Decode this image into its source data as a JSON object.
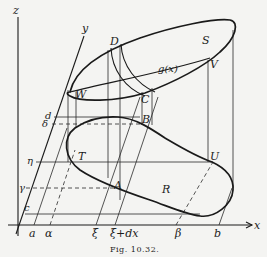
{
  "figure": {
    "caption": "Fig. 10.32.",
    "axes": {
      "x_label": "x",
      "y_label": "y",
      "z_label": "z"
    },
    "x_axis_ticks": [
      "a",
      "α",
      "ξ",
      "ξ+dx",
      "β",
      "b"
    ],
    "y_axis_ticks": [
      "c",
      "γ",
      "η",
      "δ",
      "d"
    ],
    "surface_points": {
      "D": "D",
      "C": "C",
      "W": "W",
      "V": "V",
      "S": "S",
      "curve": "g(x)"
    },
    "region_points": {
      "A": "A",
      "B": "B",
      "T": "T",
      "U": "U",
      "R": "R"
    }
  },
  "colors": {
    "background": "#f4f4f2",
    "ink": "#1a1a1a"
  }
}
